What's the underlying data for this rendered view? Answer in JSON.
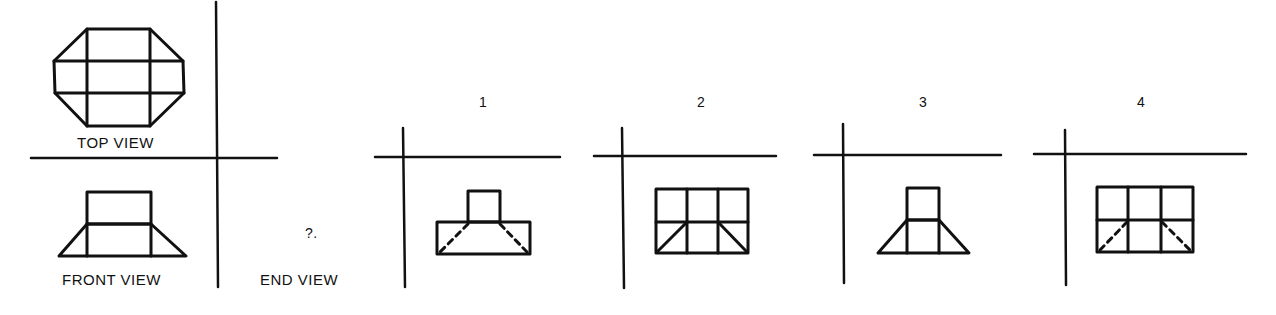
{
  "problem": {
    "labels": {
      "top_view": "TOP VIEW",
      "front_view": "FRONT VIEW",
      "end_view": "END VIEW",
      "unknown_marker": "?."
    },
    "options": [
      {
        "number": "1",
        "description": "small square atop wider rectangle with dashed hidden diagonals from inner corners to bottom corners"
      },
      {
        "number": "2",
        "description": "3x2 grid rectangle with solid diagonals in bottom-left and bottom-right cells"
      },
      {
        "number": "3",
        "description": "small square atop trapezoid with solid slanted sides"
      },
      {
        "number": "4",
        "description": "3x2 grid rectangle with dashed hidden diagonals in bottom-left and bottom-right cells"
      }
    ]
  },
  "colors": {
    "ink": "#111111",
    "paper": "#ffffff"
  }
}
